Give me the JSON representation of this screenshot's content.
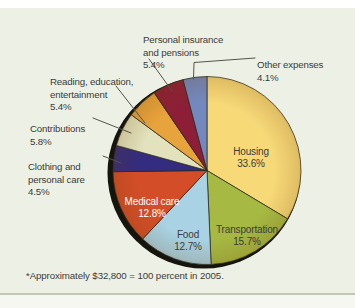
{
  "chart_data": {
    "type": "pie",
    "title": "",
    "direction": "clockwise",
    "start_angle_deg": 0,
    "unit": "percent",
    "footnote": "*Approximately $32,800 = 100 percent in 2005.",
    "slices": [
      {
        "label": "Housing",
        "value": 33.6,
        "pct_label": "33.6%",
        "color": "#F7D978",
        "label_placement": "inside"
      },
      {
        "label": "Transportation",
        "value": 15.7,
        "pct_label": "15.7%",
        "color": "#A6BA43",
        "label_placement": "inside"
      },
      {
        "label": "Food",
        "value": 12.7,
        "pct_label": "12.7%",
        "color": "#A9D3E4",
        "label_placement": "inside"
      },
      {
        "label": "Medical care",
        "value": 12.8,
        "pct_label": "12.8%",
        "color": "#D34E28",
        "label_placement": "inside",
        "label_color": "#FFFFFF"
      },
      {
        "label": "Clothing and\npersonal care",
        "value": 4.5,
        "pct_label": "4.5%",
        "color": "#342C7E",
        "label_placement": "outside"
      },
      {
        "label": "Contributions",
        "value": 5.8,
        "pct_label": "5.8%",
        "color": "#E2E2BC",
        "label_placement": "outside"
      },
      {
        "label": "Reading, education,\nentertainment",
        "value": 5.4,
        "pct_label": "5.4%",
        "color": "#E8A43C",
        "label_placement": "outside"
      },
      {
        "label": "Personal insurance\nand pensions",
        "value": 5.4,
        "pct_label": "5.4%",
        "color": "#8C1F37",
        "label_placement": "outside"
      },
      {
        "label": "Other expenses",
        "value": 4.1,
        "pct_label": "4.1%",
        "color": "#7389BD",
        "label_placement": "outside"
      }
    ]
  },
  "colors": {
    "page_bg": "#FFFFFF",
    "panel_bg": "#EDF0E5",
    "text": "#3B3B3B",
    "inside_label_light": "#FFFFFF",
    "leader_line": "#53534C",
    "pie_outline": "#2B2B20",
    "pie_shadow": "#15150E",
    "bottom_rule": "#BFC8B2",
    "below_strip_bg": "#F5F7F0"
  }
}
